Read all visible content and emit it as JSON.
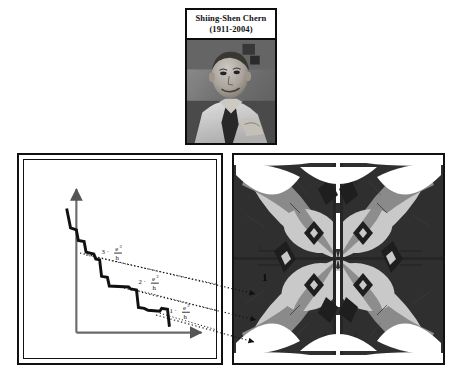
{
  "portrait": {
    "name": "Shiing-Shen Chern",
    "years": "(1911-2004)",
    "photo_alt": "portrait-photograph"
  },
  "left_panel": {
    "name": "quantized-conductance-staircase",
    "plateau_labels": [
      {
        "id": "plateau-3",
        "text": "3 ·",
        "numerator": "e",
        "exponent": "2",
        "denominator": "h"
      },
      {
        "id": "plateau-2",
        "text": "2 ·",
        "numerator": "e",
        "exponent": "2",
        "denominator": "h"
      },
      {
        "id": "plateau-1",
        "text": "1 ·",
        "numerator": "e",
        "exponent": "2",
        "denominator": "h"
      }
    ],
    "y_axis": "y-axis-arrow",
    "x_axis": "x-axis-arrow"
  },
  "right_panel": {
    "name": "hofstadter-butterfly",
    "labels": [
      {
        "id": "chern-1",
        "text": "1"
      },
      {
        "id": "chern-2",
        "text": "2"
      }
    ]
  },
  "colors": {
    "ink": "#111111",
    "light_gray": "#c9c9c9",
    "mid_gray": "#8a8a8a",
    "dark_gray": "#3a3a3a",
    "near_black": "#1a1a1a",
    "white": "#ffffff"
  },
  "connectors": {
    "count": 3,
    "style": "dotted-arrow"
  }
}
